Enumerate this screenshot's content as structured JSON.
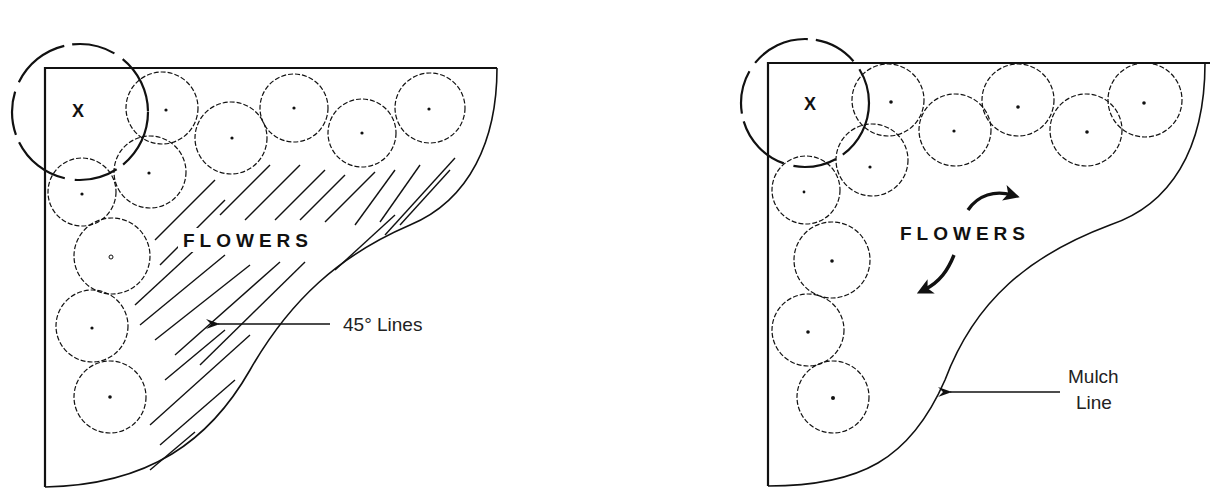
{
  "diagram": {
    "type": "planting-bed-layout",
    "panels": [
      {
        "id": "left",
        "title_label": "FLOWERS",
        "annotation": "45° Lines",
        "annotation_target": "hatched flower area",
        "tree_marker": "X",
        "shrub_count": 10
      },
      {
        "id": "right",
        "title_label": "FLOWERS",
        "annotation_line1": "Mulch",
        "annotation_line2": "Line",
        "annotation_target": "curved bed edge",
        "tree_marker": "X",
        "shrub_count": 10
      }
    ],
    "colors": {
      "ink": "#111111",
      "background": "#ffffff"
    }
  }
}
